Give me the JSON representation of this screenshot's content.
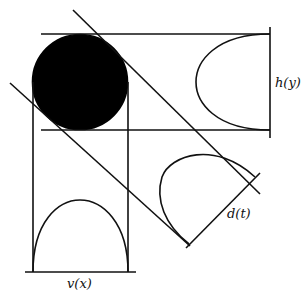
{
  "diagram": {
    "labels": {
      "h": "h(y)",
      "v": "v(x)",
      "d": "d(t)"
    },
    "colors": {
      "stroke": "#111111",
      "fill": "#000000",
      "background": "#ffffff"
    }
  }
}
